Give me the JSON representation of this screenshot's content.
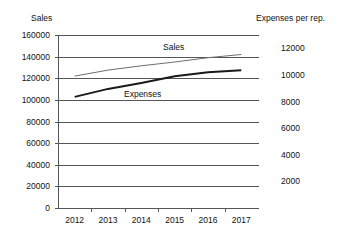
{
  "chart_data": {
    "type": "line",
    "title": "",
    "subtitle": "",
    "grid": true,
    "legend_position": "inline-annotations",
    "categories": [
      "2012",
      "2013",
      "2014",
      "2015",
      "2016",
      "2017"
    ],
    "xlabel": "",
    "left_axis": {
      "label": "Sales",
      "ylim": [
        0,
        160000
      ],
      "ticks": [
        "0",
        "20000",
        "40000",
        "60000",
        "80000",
        "100000",
        "120000",
        "140000",
        "160000"
      ],
      "tick_values": [
        0,
        20000,
        40000,
        60000,
        80000,
        100000,
        120000,
        140000,
        160000
      ]
    },
    "right_axis": {
      "label": "Expenses per rep.",
      "ylim": [
        0,
        13000
      ],
      "ticks": [
        "2000",
        "4000",
        "6000",
        "8000",
        "10000",
        "12000"
      ],
      "tick_values": [
        2000,
        4000,
        6000,
        8000,
        10000,
        12000
      ]
    },
    "series": [
      {
        "name": "Sales",
        "axis": "left",
        "annotation": "Sales",
        "color": "#6e6e6e",
        "line_width": 1,
        "values": [
          122000,
          127500,
          131500,
          135000,
          139000,
          142000
        ]
      },
      {
        "name": "Expenses",
        "axis": "right",
        "annotation": "Expenses",
        "color": "#1a1a1a",
        "line_width": 2,
        "values": [
          8350,
          8950,
          9400,
          9900,
          10200,
          10350
        ]
      }
    ]
  }
}
